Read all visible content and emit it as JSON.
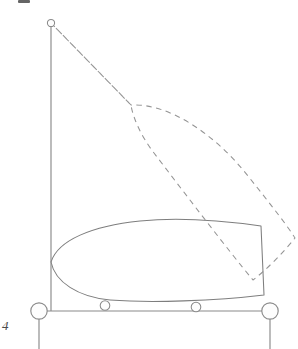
{
  "figure": {
    "page_label": "4",
    "stroke_color": "#8a8a8a",
    "solid_stroke_color": "#7e7e7e",
    "dashed_stroke_color": "#949494",
    "node_fill": "#fdfdfd",
    "background": "#ffffff",
    "canvas": {
      "width": 298,
      "height": 349
    }
  },
  "elements": {
    "mast": {
      "name": "mast-line",
      "x1": 51,
      "y1": 23,
      "x2": 51,
      "y2": 311
    },
    "deck_line": {
      "name": "deck-line",
      "x1": 39,
      "y1": 311,
      "x2": 271,
      "y2": 311
    },
    "left_post": {
      "name": "left-post-stem",
      "x1": 39,
      "y1": 319,
      "x2": 39,
      "y2": 349
    },
    "right_post": {
      "name": "right-post-stem",
      "x1": 270,
      "y1": 319,
      "x2": 270,
      "y2": 349
    },
    "masthead_node": {
      "name": "masthead-node",
      "cx": 51,
      "cy": 23,
      "r": 3.6
    },
    "left_hub_node": {
      "name": "left-hub-node",
      "cx": 39,
      "cy": 311,
      "r": 8.2
    },
    "right_hub_node": {
      "name": "right-hub-node",
      "cx": 270,
      "cy": 311,
      "r": 8.2
    },
    "keel_node_a": {
      "name": "keel-node-a",
      "cx": 105,
      "cy": 305.5,
      "r": 4.8
    },
    "keel_node_b": {
      "name": "keel-node-b",
      "cx": 196,
      "cy": 307,
      "r": 4.8
    },
    "hull_outline": {
      "name": "hull-outline",
      "path": "M 51 262 C 58 240 92 226 140 221 C 178 217 226 221 261 226 L 264 295 C 215 301 150 303 110 300 C 78 297 55 282 51 262 Z"
    },
    "sail_outline": {
      "name": "sail-outline-dashed",
      "path": "M 51 23 L 131 105 C 168 103 214 133 248 176 C 272 206 289 228 295 238 C 283 253 266 270 253 280 C 228 250 186 195 154 153 C 141 136 133 118 131 105 Z"
    },
    "luff_segment": {
      "name": "sail-luff-segment",
      "x1": 51,
      "y1": 23,
      "x2": 131,
      "y2": 105
    },
    "leech_segment": {
      "name": "sail-leech-segment",
      "x1": 253,
      "y1": 280,
      "x2": 295,
      "y2": 238
    }
  },
  "annotations": {
    "page_number_label": "4"
  }
}
